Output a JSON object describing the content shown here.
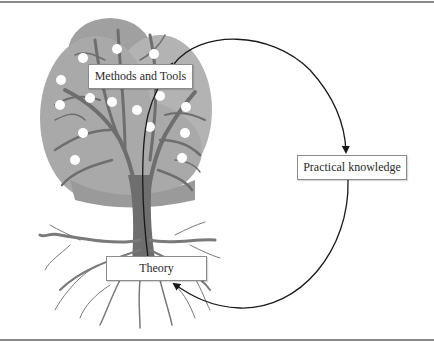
{
  "diagram": {
    "nodes": [
      {
        "id": "methods",
        "label": "Methods and Tools",
        "position": "tree canopy"
      },
      {
        "id": "practical",
        "label": "Practical knowledge",
        "position": "right"
      },
      {
        "id": "theory",
        "label": "Theory",
        "position": "tree roots"
      }
    ],
    "edges": [
      {
        "from": "methods",
        "to": "practical",
        "style": "curved arrow"
      },
      {
        "from": "practical",
        "to": "theory",
        "style": "curved arrow"
      },
      {
        "from": "theory",
        "to": "methods",
        "style": "arrow along trunk"
      }
    ],
    "colors": {
      "canopy": "#a9a9a9",
      "canopy_dark": "#9a9a9a",
      "trunk": "#6e6e6e",
      "fruit": "#ffffff",
      "arrow": "#1a1a1a",
      "box_border": "#8c8c8c",
      "rule": "#8a8a8a"
    }
  }
}
